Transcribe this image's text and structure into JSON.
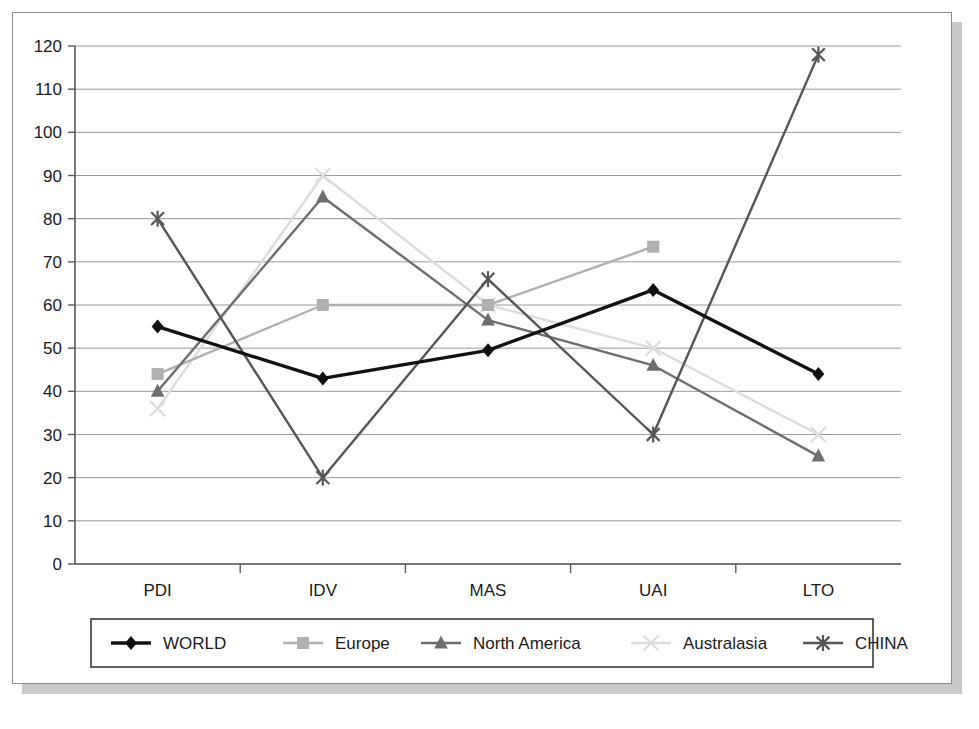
{
  "chart_data": {
    "type": "line",
    "title": "",
    "xlabel": "",
    "ylabel": "",
    "categories": [
      "PDI",
      "IDV",
      "MAS",
      "UAI",
      "LTO"
    ],
    "ylim": [
      0,
      120
    ],
    "ytick_step": 10,
    "yticks": [
      0,
      10,
      20,
      30,
      40,
      50,
      60,
      70,
      80,
      90,
      100,
      110,
      120
    ],
    "grid": true,
    "legend_position": "bottom",
    "series": [
      {
        "name": "WORLD",
        "color": "#111111",
        "marker": "diamond",
        "values": [
          55,
          43,
          49.5,
          63.5,
          44
        ]
      },
      {
        "name": "Europe",
        "color": "#b0b0b0",
        "marker": "square",
        "values": [
          44,
          60,
          60,
          73.5,
          null
        ]
      },
      {
        "name": "North America",
        "color": "#6e6e6e",
        "marker": "triangle",
        "values": [
          40,
          85,
          56.5,
          46,
          25
        ]
      },
      {
        "name": "Australasia",
        "color": "#dcdcdc",
        "marker": "x",
        "values": [
          36,
          90,
          60,
          50,
          30
        ]
      },
      {
        "name": "CHINA",
        "color": "#555555",
        "marker": "asterisk",
        "values": [
          80,
          20,
          66,
          30,
          118
        ]
      }
    ]
  },
  "legend": {
    "items": [
      {
        "label": "WORLD"
      },
      {
        "label": "Europe"
      },
      {
        "label": "North America"
      },
      {
        "label": "Australasia"
      },
      {
        "label": "CHINA"
      }
    ]
  },
  "axis": {
    "y_tick_labels": [
      "120",
      "110",
      "100",
      "90",
      "80",
      "70",
      "60",
      "50",
      "40",
      "30",
      "20",
      "10",
      "0"
    ],
    "x_tick_labels": [
      "PDI",
      "IDV",
      "MAS",
      "UAI",
      "LTO"
    ]
  }
}
